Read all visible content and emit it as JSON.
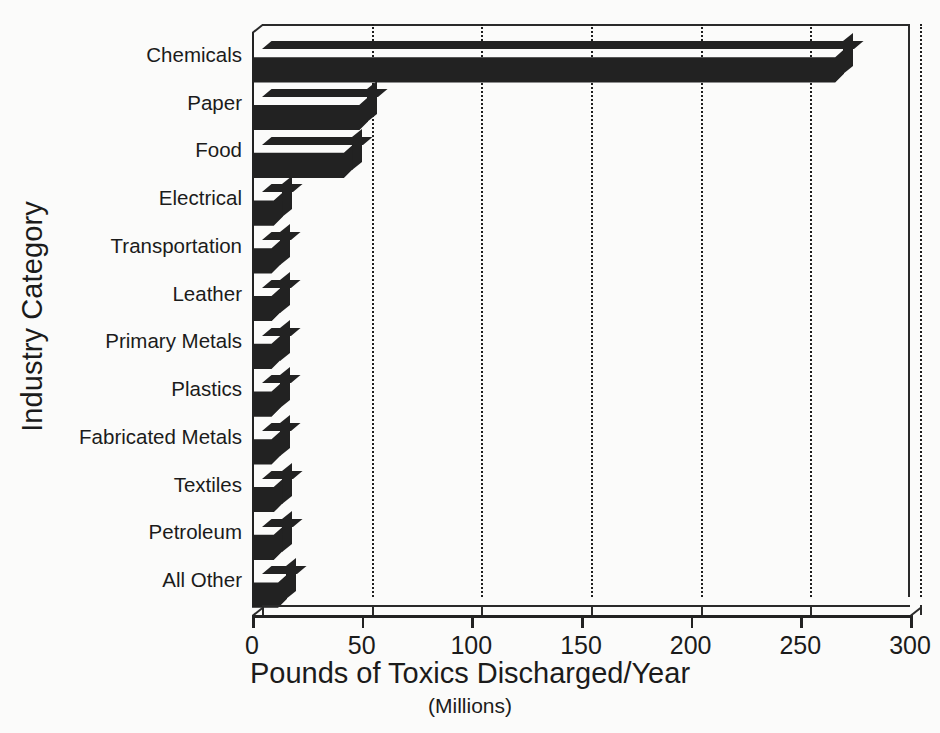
{
  "chart_data": {
    "type": "bar",
    "orientation": "horizontal",
    "title": "",
    "xlabel": "Pounds of Toxics Discharged/Year",
    "xlabel_sub": "(Millions)",
    "ylabel": "Industry Category",
    "xlim": [
      0,
      300
    ],
    "ylim": null,
    "grid": true,
    "grid_axis": "x",
    "grid_style": "dotted",
    "legend": false,
    "style": "3d-bar",
    "bar_color": "#222222",
    "background_color": "#fbfbfa",
    "xticks": [
      0,
      50,
      100,
      150,
      200,
      250,
      300
    ],
    "xticklabels": [
      "0",
      "50",
      "100",
      "150",
      "200",
      "250",
      "300"
    ],
    "categories": [
      "Chemicals",
      "Paper",
      "Food",
      "Electrical",
      "Transportation",
      "Leather",
      "Primary Metals",
      "Plastics",
      "Fabricated Metals",
      "Textiles",
      "Petroleum",
      "All Other"
    ],
    "values": [
      270,
      53,
      46,
      14,
      13,
      13,
      13,
      13,
      13,
      14,
      14,
      16
    ],
    "units": "millions of pounds per year"
  }
}
